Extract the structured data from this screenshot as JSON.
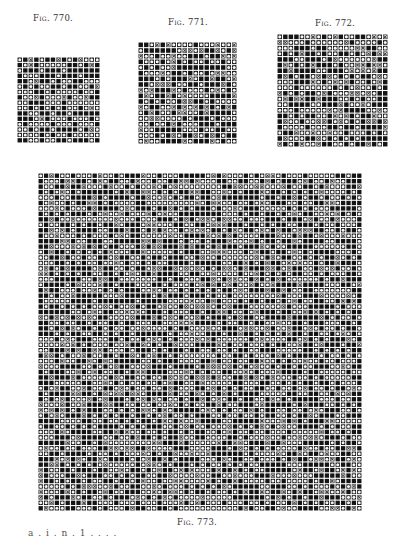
{
  "page": {
    "type": "scanned textbook page — weave design point-paper figures"
  },
  "figures": [
    {
      "id": "fig-770",
      "caption": "Fig. 770.",
      "cols": 15,
      "rows": 16,
      "legend": [
        "black: riser",
        "dot: sinker",
        "cross: secondary interlacing"
      ],
      "seed": 770,
      "density": {
        "black": 0.5,
        "dot": 0.48,
        "cross": 0.02
      }
    },
    {
      "id": "fig-771",
      "caption": "Fig. 771.",
      "cols": 18,
      "rows": 18,
      "seed": 771,
      "density": {
        "black": 0.42,
        "dot": 0.4,
        "cross": 0.18
      }
    },
    {
      "id": "fig-772",
      "caption": "Fig. 772.",
      "cols": 20,
      "rows": 20,
      "seed": 772,
      "density": {
        "black": 0.4,
        "dot": 0.42,
        "cross": 0.18
      }
    },
    {
      "id": "fig-773",
      "caption": "Fig. 773.",
      "cols": 60,
      "rows": 62,
      "seed": 773,
      "density": {
        "black": 0.44,
        "dot": 0.44,
        "cross": 0.12
      }
    }
  ],
  "footer_fragment": "a . i . n . 1 . . . ."
}
